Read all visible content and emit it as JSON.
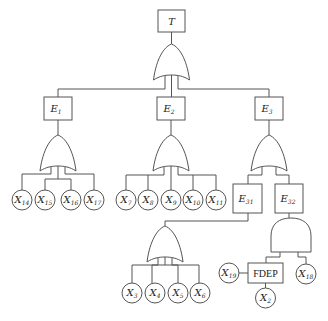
{
  "diagram": {
    "type": "fault-tree",
    "top_event": {
      "id": "T",
      "label": "T",
      "gate": "OR",
      "children": [
        "E1",
        "E2",
        "E3"
      ]
    },
    "events": [
      {
        "id": "E1",
        "label": "E",
        "sub": "1",
        "gate": "OR",
        "children": [
          "X14",
          "X15",
          "X16",
          "X17"
        ]
      },
      {
        "id": "E2",
        "label": "E",
        "sub": "2",
        "gate": "OR",
        "children": [
          "X7",
          "X8",
          "X9",
          "X10",
          "X11"
        ]
      },
      {
        "id": "E3",
        "label": "E",
        "sub": "3",
        "gate": "OR",
        "children": [
          "E31",
          "E32"
        ]
      },
      {
        "id": "E31",
        "label": "E",
        "sub": "31",
        "gate": "OR",
        "children": [
          "X3",
          "X4",
          "X5",
          "X6"
        ]
      },
      {
        "id": "E32",
        "label": "E",
        "sub": "32",
        "gate": "AND",
        "children": [
          "FDEP",
          "X18"
        ]
      }
    ],
    "fdep": {
      "label": "FDEP",
      "trigger": "X19",
      "dependent": [
        "X2"
      ]
    },
    "basic_events": {
      "e1": [
        {
          "l": "X",
          "s": "14"
        },
        {
          "l": "X",
          "s": "15"
        },
        {
          "l": "X",
          "s": "16"
        },
        {
          "l": "X",
          "s": "17"
        }
      ],
      "e2": [
        {
          "l": "X",
          "s": "7"
        },
        {
          "l": "X",
          "s": "8"
        },
        {
          "l": "X",
          "s": "9"
        },
        {
          "l": "X",
          "s": "10"
        },
        {
          "l": "X",
          "s": "11"
        }
      ],
      "e31": [
        {
          "l": "X",
          "s": "3"
        },
        {
          "l": "X",
          "s": "4"
        },
        {
          "l": "X",
          "s": "5"
        },
        {
          "l": "X",
          "s": "6"
        }
      ],
      "x19": {
        "l": "X",
        "s": "19"
      },
      "x18": {
        "l": "X",
        "s": "18"
      },
      "x2": {
        "l": "X",
        "s": "2"
      }
    }
  }
}
